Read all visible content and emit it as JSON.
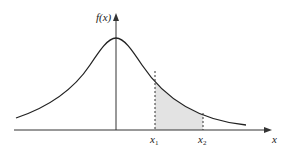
{
  "diagram": {
    "type": "normal-distribution-curve",
    "y_axis_label": "f(x)",
    "x_axis_label": "x",
    "lower_bound_label": "x",
    "lower_bound_sub": "1",
    "upper_bound_label": "x",
    "upper_bound_sub": "2",
    "shaded_region": "area under f(x) between x1 and x2",
    "colors": {
      "curve": "#222222",
      "axes": "#333333",
      "shade": "#e3e3e3",
      "dashed": "#333333"
    }
  }
}
